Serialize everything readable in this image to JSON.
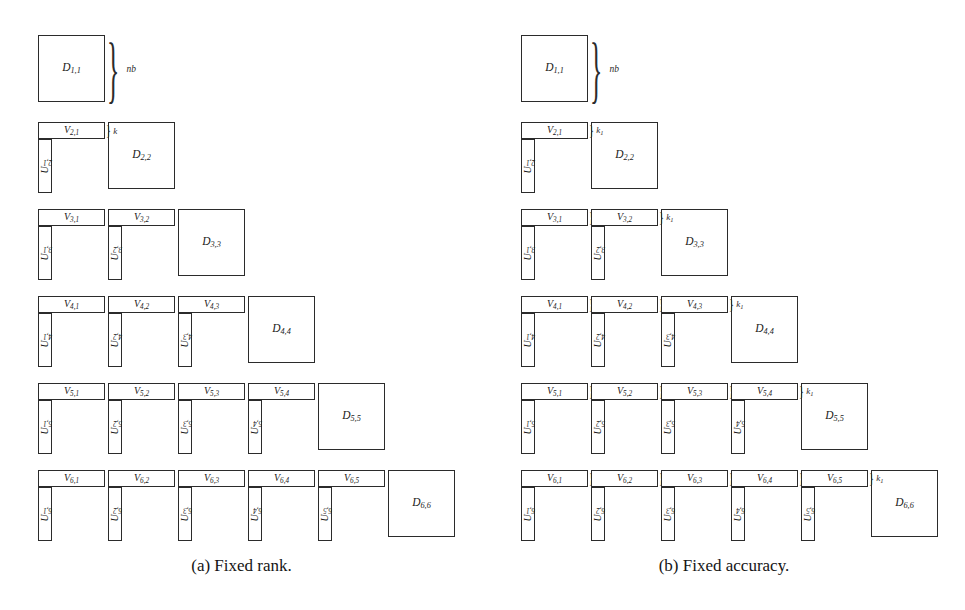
{
  "figure": {
    "n_blocks": 6,
    "panels": [
      {
        "id": "a",
        "caption": "(a) Fixed rank.",
        "row_height_label": "nb",
        "rank_label_mode": "constant",
        "diagonal_blocks": [
          "D1,1",
          "D2,2",
          "D3,3",
          "D4,4",
          "D5,5",
          "D6,6"
        ],
        "rows": [
          {
            "index": 1,
            "v_blocks": [],
            "u_blocks": [],
            "k_labels": []
          },
          {
            "index": 2,
            "v_blocks": [
              "V2,1"
            ],
            "u_blocks": [
              "U2,1"
            ],
            "k_labels": [
              "k"
            ]
          },
          {
            "index": 3,
            "v_blocks": [
              "V3,1",
              "V3,2"
            ],
            "u_blocks": [
              "U3,1",
              "U3,2"
            ],
            "k_labels": [
              "",
              ""
            ]
          },
          {
            "index": 4,
            "v_blocks": [
              "V4,1",
              "V4,2",
              "V4,3"
            ],
            "u_blocks": [
              "U4,1",
              "U4,2",
              "U4,3"
            ],
            "k_labels": [
              "",
              "",
              ""
            ]
          },
          {
            "index": 5,
            "v_blocks": [
              "V5,1",
              "V5,2",
              "V5,3",
              "V5,4"
            ],
            "u_blocks": [
              "U5,1",
              "U5,2",
              "U5,3",
              "U5,4"
            ],
            "k_labels": [
              "",
              "",
              "",
              ""
            ]
          },
          {
            "index": 6,
            "v_blocks": [
              "V6,1",
              "V6,2",
              "V6,3",
              "V6,4",
              "V6,5"
            ],
            "u_blocks": [
              "U6,1",
              "U6,2",
              "U6,3",
              "U6,4",
              "U6,5"
            ],
            "k_labels": [
              "",
              "",
              "",
              "",
              ""
            ]
          }
        ]
      },
      {
        "id": "b",
        "caption": "(b) Fixed accuracy.",
        "row_height_label": "nb",
        "rank_label_mode": "varying",
        "diagonal_blocks": [
          "D1,1",
          "D2,2",
          "D3,3",
          "D4,4",
          "D5,5",
          "D6,6"
        ],
        "rows": [
          {
            "index": 1,
            "v_blocks": [],
            "u_blocks": [],
            "k_labels": []
          },
          {
            "index": 2,
            "v_blocks": [
              "V2,1"
            ],
            "u_blocks": [
              "U2,1"
            ],
            "k_labels": [
              "k1"
            ]
          },
          {
            "index": 3,
            "v_blocks": [
              "V3,1",
              "V3,2"
            ],
            "u_blocks": [
              "U3,1",
              "U3,2"
            ],
            "k_labels": [
              "k2",
              "k1"
            ]
          },
          {
            "index": 4,
            "v_blocks": [
              "V4,1",
              "V4,2",
              "V4,3"
            ],
            "u_blocks": [
              "U4,1",
              "U4,2",
              "U4,3"
            ],
            "k_labels": [
              "k3",
              "k2",
              "k1"
            ]
          },
          {
            "index": 5,
            "v_blocks": [
              "V5,1",
              "V5,2",
              "V5,3",
              "V5,4"
            ],
            "u_blocks": [
              "U5,1",
              "U5,2",
              "U5,3",
              "U5,4"
            ],
            "k_labels": [
              "k4",
              "k3",
              "k2",
              "k1"
            ]
          },
          {
            "index": 6,
            "v_blocks": [
              "V6,1",
              "V6,2",
              "V6,3",
              "V6,4",
              "V6,5"
            ],
            "u_blocks": [
              "U6,1",
              "U6,2",
              "U6,3",
              "U6,4",
              "U6,5"
            ],
            "k_labels": [
              "k5",
              "k4",
              "k3",
              "k2",
              "k1"
            ]
          }
        ]
      }
    ],
    "brace_glyph": "}",
    "colors": {
      "background": "#ffffff",
      "stroke": "#2b2b2b",
      "text": "#1a1a1a"
    }
  }
}
